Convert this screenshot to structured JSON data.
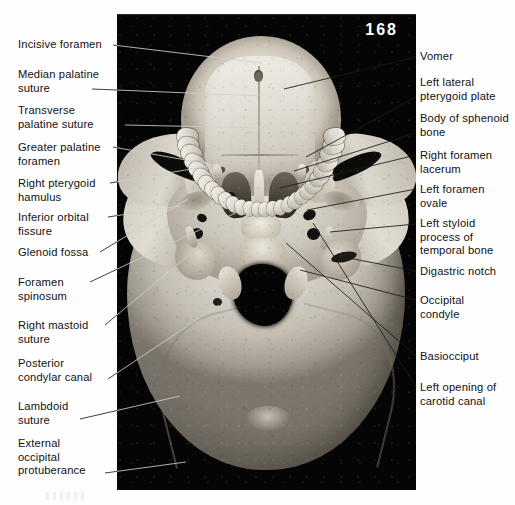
{
  "figure": {
    "page_number": "168",
    "plate_description": "Inferior (basal) view photograph of a dried human skull, labelled anatomy plate"
  },
  "labels_left": [
    {
      "id": "incisive-foramen",
      "text": "Incisive foramen",
      "x": 18,
      "y": 38,
      "line": [
        113,
        45,
        262,
        63
      ]
    },
    {
      "id": "median-palatine-suture",
      "text": "Median palatine\nsuture",
      "x": 18,
      "y": 68,
      "line": [
        92,
        89,
        263,
        96
      ]
    },
    {
      "id": "transverse-palatine-suture",
      "text": "Transverse\npalatine suture",
      "x": 18,
      "y": 104,
      "line": [
        125,
        125,
        265,
        128
      ]
    },
    {
      "id": "greater-palatine-foramen",
      "text": "Greater palatine\nforamen",
      "x": 18,
      "y": 141,
      "line": [
        113,
        147,
        225,
        167
      ]
    },
    {
      "id": "right-pterygoid-hamulus",
      "text": "Right pterygoid\nhamulus",
      "x": 18,
      "y": 177,
      "line": [
        110,
        183,
        214,
        165
      ]
    },
    {
      "id": "inferior-orbital-fissure",
      "text": "Inferior orbital\nfissure",
      "x": 18,
      "y": 211,
      "line": [
        108,
        217,
        180,
        206
      ]
    },
    {
      "id": "glenoid-fossa",
      "text": "Glenoid fossa",
      "x": 18,
      "y": 246,
      "line": [
        100,
        252,
        188,
        199
      ]
    },
    {
      "id": "foramen-spinosum",
      "text": "Foramen\nspinosum",
      "x": 18,
      "y": 276,
      "line": [
        90,
        282,
        246,
        208
      ]
    },
    {
      "id": "right-mastoid-suture",
      "text": "Right mastoid\nsuture",
      "x": 18,
      "y": 319,
      "line": [
        105,
        325,
        190,
        254
      ]
    },
    {
      "id": "posterior-condylar-canal",
      "text": "Posterior\ncondylar canal",
      "x": 18,
      "y": 357,
      "line": [
        108,
        379,
        219,
        305
      ]
    },
    {
      "id": "lambdoid-suture",
      "text": "Lambdoid\nsuture",
      "x": 18,
      "y": 400,
      "line": [
        80,
        419,
        180,
        396
      ]
    },
    {
      "id": "external-occipital-protuberance",
      "text": "External\noccipital\nprotuberance",
      "x": 18,
      "y": 437,
      "line": [
        105,
        473,
        186,
        462
      ]
    }
  ],
  "labels_right": [
    {
      "id": "vomer",
      "text": "Vomer",
      "x": 420,
      "y": 50,
      "line": [
        416,
        57,
        284,
        89
      ]
    },
    {
      "id": "left-lateral-pterygoid-plate",
      "text": "Left lateral\npterygoid plate",
      "x": 420,
      "y": 76,
      "line": [
        416,
        97,
        306,
        157
      ]
    },
    {
      "id": "body-of-sphenoid-bone",
      "text": "Body of sphenoid\nbone",
      "x": 420,
      "y": 112,
      "line": [
        416,
        133,
        294,
        171
      ]
    },
    {
      "id": "right-foramen-lacerum",
      "text": "Right foramen\nlacerum",
      "x": 420,
      "y": 149,
      "line": [
        416,
        155,
        280,
        188
      ]
    },
    {
      "id": "left-foramen-ovale",
      "text": "Left foramen\novale",
      "x": 420,
      "y": 183,
      "line": [
        416,
        189,
        307,
        210
      ]
    },
    {
      "id": "left-styloid-process",
      "text": "Left styloid\nprocess of\ntemporal bone",
      "x": 420,
      "y": 217,
      "line": [
        416,
        224,
        330,
        232
      ]
    },
    {
      "id": "digastric-notch",
      "text": "Digastric notch",
      "x": 420,
      "y": 265,
      "line": [
        416,
        271,
        338,
        256
      ]
    },
    {
      "id": "occipital-condyle",
      "text": "Occipital\ncondyle",
      "x": 420,
      "y": 294,
      "line": [
        416,
        300,
        300,
        270
      ]
    },
    {
      "id": "basiocciput",
      "text": "Basiocciput",
      "x": 420,
      "y": 350,
      "line": [
        416,
        356,
        286,
        243
      ]
    },
    {
      "id": "left-opening-of-carotid-canal",
      "text": "Left opening of\ncarotid canal",
      "x": 420,
      "y": 381,
      "line": [
        416,
        387,
        313,
        223
      ]
    }
  ]
}
